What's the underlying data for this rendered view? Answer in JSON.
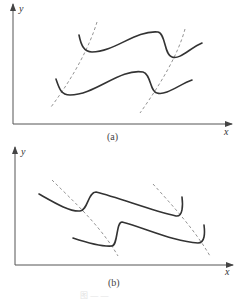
{
  "panels": [
    {
      "id": "a",
      "caption": "(a)",
      "x_label": "x",
      "y_label": "y",
      "description": "Two rising S-shaped solid curves intersected by two dashed lines sloping up to the right"
    },
    {
      "id": "b",
      "caption": "(b)",
      "x_label": "x",
      "y_label": "y",
      "description": "Two falling S-shaped solid curves intersected by two dashed lines sloping down to the right"
    }
  ],
  "figure_caption": "图 — —"
}
